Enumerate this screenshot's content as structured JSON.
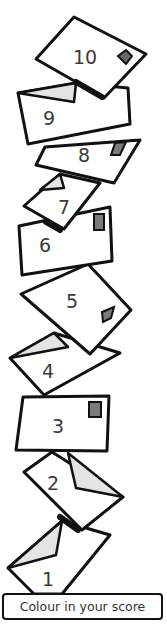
{
  "envelopes": [
    {
      "number": "1",
      "stamp": false,
      "flap_open": true
    },
    {
      "number": "2",
      "stamp": false,
      "flap_open": true
    },
    {
      "number": "3",
      "stamp": true,
      "flap_open": false
    },
    {
      "number": "4",
      "stamp": false,
      "flap_open": true
    },
    {
      "number": "5",
      "stamp": true,
      "flap_open": false
    },
    {
      "number": "6",
      "stamp": true,
      "flap_open": false
    },
    {
      "number": "7",
      "stamp": false,
      "flap_open": true
    },
    {
      "number": "8",
      "stamp": true,
      "flap_open": false
    },
    {
      "number": "9",
      "stamp": false,
      "flap_open": true
    },
    {
      "number": "10",
      "stamp": true,
      "flap_open": false
    }
  ],
  "label": "Colour in your score",
  "colors": {
    "outline": "#111111",
    "flap_fill": "#e4e4e4",
    "stamp_fill": "#7a7a7a",
    "number_text": "#3a3a3a"
  }
}
